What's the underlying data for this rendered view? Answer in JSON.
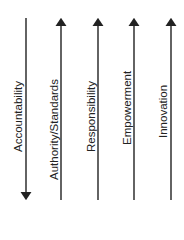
{
  "diagram": {
    "arrows": [
      {
        "label": "Accountability",
        "direction": "down",
        "x": 26,
        "label_bottom": 152
      },
      {
        "label": "Authority/Standards",
        "direction": "up",
        "x": 61,
        "label_bottom": 180
      },
      {
        "label": "Responsibility",
        "direction": "up",
        "x": 98,
        "label_bottom": 152
      },
      {
        "label": "Empowerment",
        "direction": "up",
        "x": 134,
        "label_bottom": 145
      },
      {
        "label": "Innovation",
        "direction": "up",
        "x": 171,
        "label_bottom": 138
      }
    ],
    "line_color": "#222222"
  }
}
